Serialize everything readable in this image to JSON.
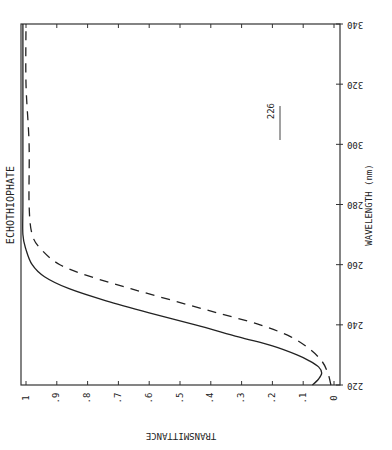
{
  "chart_data": {
    "type": "line",
    "title": "ECHOTHIOPHATE",
    "orientation": "rotated 90° (image rotated; wavelength runs along vertical axis, transmittance along horizontal, labels upside-down/mirrored)",
    "xlabel": "WAVELENGTH (nm)",
    "ylabel": "TRANSMITTANCE",
    "xlim": [
      220,
      340
    ],
    "ylim": [
      0,
      1.05
    ],
    "x_ticks": [
      "220",
      "240",
      "260",
      "280",
      "300",
      "320",
      "340"
    ],
    "y_ticks": [
      "0",
      ".1",
      ".2",
      ".3",
      ".4",
      ".5",
      ".6",
      ".7",
      ".8",
      ".9",
      "1"
    ],
    "annotation": "226",
    "grid": false,
    "series": [
      {
        "name": "solid",
        "style": "solid",
        "x": [
          220,
          222,
          224,
          226,
          228,
          230,
          233,
          236,
          240,
          244,
          248,
          252,
          256,
          260,
          265,
          270,
          280,
          300,
          340
        ],
        "y": [
          0.07,
          0.05,
          0.04,
          0.05,
          0.08,
          0.12,
          0.2,
          0.31,
          0.45,
          0.6,
          0.74,
          0.86,
          0.94,
          0.98,
          1.0,
          1.01,
          1.01,
          1.01,
          1.01
        ]
      },
      {
        "name": "dashed",
        "style": "dashed",
        "x": [
          220,
          224,
          228,
          232,
          236,
          240,
          244,
          248,
          252,
          256,
          260,
          265,
          270,
          280,
          300,
          320,
          340
        ],
        "y": [
          0.01,
          0.02,
          0.04,
          0.08,
          0.14,
          0.24,
          0.38,
          0.52,
          0.66,
          0.79,
          0.89,
          0.95,
          0.98,
          0.99,
          0.99,
          1.0,
          1.0
        ]
      }
    ]
  }
}
